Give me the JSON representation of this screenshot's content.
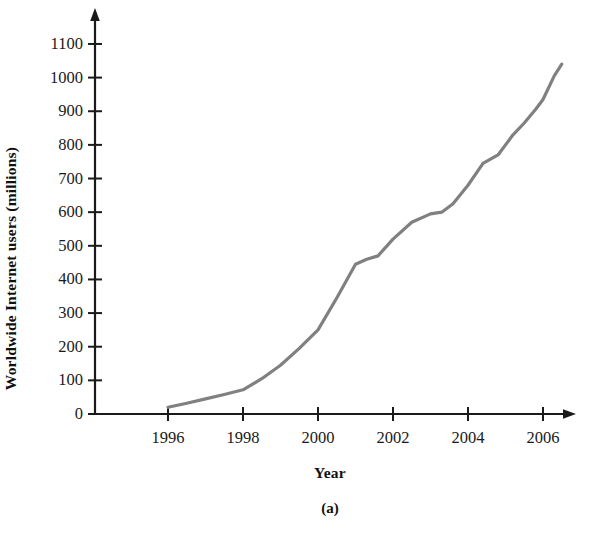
{
  "figure": {
    "caption": "(a)",
    "background_color": "#ffffff",
    "line_color": "#808080",
    "axis_color": "#1a1a1a"
  },
  "chart_data": {
    "type": "line",
    "title": "",
    "subtitle": "",
    "xlabel": "Year",
    "ylabel": "Worldwide Internet users (millions)",
    "xlim": [
      1994.0,
      2007.2
    ],
    "ylim": [
      0,
      1180
    ],
    "grid": false,
    "legend": null,
    "x_ticks": [
      1996,
      1998,
      2000,
      2002,
      2004,
      2006
    ],
    "x_tick_labels": [
      "1996",
      "1998",
      "2000",
      "2002",
      "2004",
      "2006"
    ],
    "y_ticks": [
      0,
      100,
      200,
      300,
      400,
      500,
      600,
      700,
      800,
      900,
      1000,
      1100
    ],
    "y_tick_labels": [
      "0",
      "100",
      "200",
      "300",
      "400",
      "500",
      "600",
      "700",
      "800",
      "900",
      "1000",
      "1100"
    ],
    "series": [
      {
        "name": "Worldwide Internet users",
        "color": "#808080",
        "x": [
          1996.0,
          1996.5,
          1997.0,
          1997.5,
          1998.0,
          1998.5,
          1999.0,
          1999.5,
          2000.0,
          2000.5,
          2001.0,
          2001.3,
          2001.6,
          2002.0,
          2002.5,
          2003.0,
          2003.3,
          2003.6,
          2004.0,
          2004.4,
          2004.8,
          2005.2,
          2005.5,
          2005.8,
          2006.0,
          2006.3,
          2006.5
        ],
        "y": [
          20,
          32,
          45,
          58,
          72,
          105,
          145,
          195,
          250,
          345,
          445,
          460,
          470,
          520,
          570,
          595,
          600,
          625,
          680,
          745,
          770,
          830,
          865,
          905,
          935,
          1005,
          1040
        ]
      }
    ]
  }
}
